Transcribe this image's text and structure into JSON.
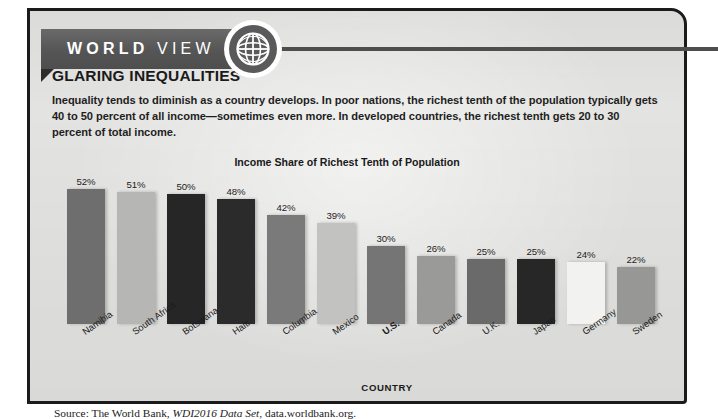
{
  "banner": {
    "word1": "WORLD",
    "word2": "VIEW",
    "icon": "globe-icon"
  },
  "article": {
    "headline": "GLARING INEQUALITIES",
    "lede": "Inequality tends to diminish as a country develops. In poor nations, the richest tenth of the population typically gets 40 to 50 percent of all income—sometimes even more. In developed countries, the richest tenth gets 20 to 30 percent of total income."
  },
  "source": {
    "prefix": "Source: The World Bank, ",
    "italic": "WDI2016 Data Set",
    "suffix": ", data.worldbank.org."
  },
  "chart_data": {
    "type": "bar",
    "title": "Income Share of Richest Tenth of Population",
    "xlabel": "COUNTRY",
    "ylabel": "",
    "ylim": [
      0,
      52
    ],
    "grid": false,
    "legend": false,
    "categories": [
      "Namibia",
      "South Africa",
      "Botswana",
      "Haiti",
      "Columbia",
      "Mexico",
      "U.S.",
      "Canada",
      "U.K.",
      "Japan",
      "Germany",
      "Sweden"
    ],
    "values": [
      52,
      51,
      50,
      48,
      42,
      39,
      30,
      26,
      25,
      25,
      24,
      22
    ],
    "value_labels": [
      "52%",
      "51%",
      "50%",
      "48%",
      "42%",
      "39%",
      "30%",
      "26%",
      "25%",
      "25%",
      "24%",
      "22%"
    ],
    "bar_colors": [
      "#6e6e6e",
      "#b6b6b4",
      "#262626",
      "#2b2b2b",
      "#7a7a7a",
      "#c2c2c0",
      "#757575",
      "#9a9a98",
      "#6a6a6a",
      "#272727",
      "#f2f2f0",
      "#979795"
    ],
    "highlight_category": "U.S."
  },
  "colors": {
    "panel_background": "#e3e3e1",
    "panel_border": "#1b1b1b",
    "ribbon": "#5a5a5a",
    "ribbon_text": "#ffffff",
    "text": "#1a1a1a"
  }
}
